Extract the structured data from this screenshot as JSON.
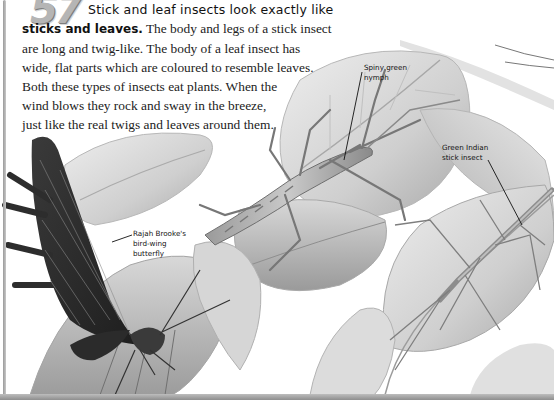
{
  "fact": {
    "number": "57",
    "headline": "Stick and leaf insects look exactly like",
    "lead": "sticks and leaves.",
    "body_lines": [
      " The body and legs of a stick insect",
      "are long and twig-like. The body of a leaf insect has",
      "wide, flat parts which are coloured to resemble leaves.",
      "Both these types of insects eat plants. When the",
      "wind blows they rock and sway in the breeze,",
      "just like the real twigs and leaves around them."
    ]
  },
  "labels": {
    "nymph": [
      "Spiny green",
      "nymph"
    ],
    "stick_insect": [
      "Green Indian",
      "stick insect"
    ],
    "butterfly": [
      "Rajah Brooke's",
      "bird-wing",
      "butterfly"
    ]
  },
  "illustration": {
    "subjects": [
      "spiny-green-nymph",
      "green-indian-stick-insect",
      "rajah-brookes-bird-wing-butterfly",
      "leaves"
    ],
    "colors": {
      "leaf_light": "#e4e4e4",
      "leaf_mid": "#c4c4c4",
      "leaf_dark": "#9c9c9c",
      "insect": "#8a8a8a",
      "butterfly_wing": "#2a2a2a",
      "text": "#222222"
    }
  }
}
